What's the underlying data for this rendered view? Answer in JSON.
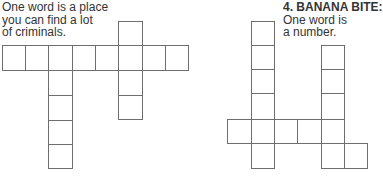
{
  "puzzles": [
    {
      "number": "",
      "title": "",
      "clue_lines": [
        "One word is a place",
        "you can find a lot",
        "of criminals."
      ],
      "cells": [
        {
          "x": 2,
          "y": 45,
          "w": 24,
          "h": 26
        },
        {
          "x": 25,
          "y": 45,
          "w": 24,
          "h": 26
        },
        {
          "x": 48,
          "y": 45,
          "w": 25,
          "h": 26
        },
        {
          "x": 72,
          "y": 45,
          "w": 24,
          "h": 26
        },
        {
          "x": 95,
          "y": 45,
          "w": 24,
          "h": 26
        },
        {
          "x": 118,
          "y": 45,
          "w": 25,
          "h": 26
        },
        {
          "x": 142,
          "y": 45,
          "w": 24,
          "h": 26
        },
        {
          "x": 165,
          "y": 45,
          "w": 24,
          "h": 26
        },
        {
          "x": 118,
          "y": 21,
          "w": 25,
          "h": 25
        },
        {
          "x": 48,
          "y": 70,
          "w": 25,
          "h": 26
        },
        {
          "x": 48,
          "y": 95,
          "w": 25,
          "h": 26
        },
        {
          "x": 48,
          "y": 120,
          "w": 25,
          "h": 25
        },
        {
          "x": 48,
          "y": 144,
          "w": 25,
          "h": 25
        },
        {
          "x": 118,
          "y": 70,
          "w": 25,
          "h": 26
        },
        {
          "x": 118,
          "y": 95,
          "w": 25,
          "h": 25
        }
      ]
    },
    {
      "number": "4.",
      "title": "BANANA BITE:",
      "clue_lines": [
        "One word is",
        "a number."
      ],
      "cells": [
        {
          "x": 251,
          "y": 21,
          "w": 24,
          "h": 25
        },
        {
          "x": 251,
          "y": 45,
          "w": 24,
          "h": 25
        },
        {
          "x": 251,
          "y": 69,
          "w": 24,
          "h": 25
        },
        {
          "x": 251,
          "y": 93,
          "w": 24,
          "h": 27
        },
        {
          "x": 227,
          "y": 119,
          "w": 25,
          "h": 25
        },
        {
          "x": 251,
          "y": 119,
          "w": 24,
          "h": 25
        },
        {
          "x": 274,
          "y": 119,
          "w": 24,
          "h": 25
        },
        {
          "x": 297,
          "y": 119,
          "w": 25,
          "h": 25
        },
        {
          "x": 251,
          "y": 143,
          "w": 24,
          "h": 26
        },
        {
          "x": 321,
          "y": 45,
          "w": 24,
          "h": 25
        },
        {
          "x": 321,
          "y": 69,
          "w": 24,
          "h": 25
        },
        {
          "x": 321,
          "y": 93,
          "w": 24,
          "h": 27
        },
        {
          "x": 321,
          "y": 119,
          "w": 24,
          "h": 25
        },
        {
          "x": 321,
          "y": 143,
          "w": 24,
          "h": 26
        },
        {
          "x": 344,
          "y": 143,
          "w": 24,
          "h": 26
        }
      ]
    }
  ]
}
